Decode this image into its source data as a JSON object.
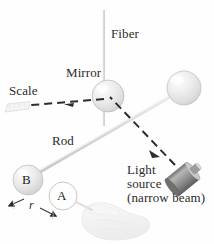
{
  "figure": {
    "type": "physics-diagram",
    "width": 214,
    "height": 244,
    "background_color": "#fefefe"
  },
  "labels": {
    "fiber": "Fiber",
    "mirror": "Mirror",
    "scale": "Scale",
    "rod": "Rod",
    "light_source_line1": "Light",
    "light_source_line2": "source",
    "light_source_line3": "(narrow beam)",
    "distance_r": "r",
    "sphere_b": "B",
    "sphere_a": "A"
  },
  "colors": {
    "text": "#2b2b2b",
    "beam": "#2c2c2c",
    "rod": "#d8d8d8",
    "fiber": "#c9c9c9",
    "sphere_fill": "#e4e4e4",
    "sphere_stroke": "#bdbdbd",
    "source_body": "#a0a0a0",
    "hand": "#ececec"
  },
  "elements": {
    "fiber_line": {
      "x": 104,
      "y_top": 10,
      "y_bottom": 126
    },
    "mirror_sphere": {
      "cx": 108,
      "cy": 96,
      "r": 16
    },
    "right_sphere": {
      "cx": 184,
      "cy": 88,
      "r": 17
    },
    "sphere_b_ball": {
      "cx": 28,
      "cy": 180,
      "r": 15
    },
    "sphere_a_ball": {
      "cx": 63,
      "cy": 196,
      "r": 14
    },
    "rod_line": {
      "x1": 30,
      "y1": 177,
      "x2": 179,
      "y2": 92
    },
    "reflected_beam": {
      "x1": 104,
      "y1": 98,
      "x2": 16,
      "y2": 106
    },
    "incident_beam": {
      "x1": 176,
      "y1": 166,
      "x2": 108,
      "y2": 95
    },
    "light_source_cylinder": {
      "x1": 172,
      "y1": 163,
      "x2": 197,
      "y2": 194
    },
    "scale_ruler": {
      "x": 5,
      "y": 102,
      "w": 26,
      "h": 11
    }
  }
}
